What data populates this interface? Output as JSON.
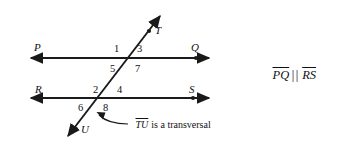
{
  "figure": {
    "type": "geometry-diagram",
    "colors": {
      "line": "#1a1a1a",
      "text": "#111111",
      "background": "#ffffff"
    },
    "points": [
      {
        "label": "P",
        "x": 34,
        "y": 42,
        "on": "line-pq",
        "dot_x": 38,
        "dot_y": 58
      },
      {
        "label": "Q",
        "x": 191,
        "y": 42,
        "on": "line-pq",
        "dot_x": 196,
        "dot_y": 58
      },
      {
        "label": "R",
        "x": 35,
        "y": 84,
        "on": "line-rs",
        "dot_x": 38,
        "dot_y": 98
      },
      {
        "label": "S",
        "x": 189,
        "y": 84,
        "on": "line-rs",
        "dot_x": 193,
        "dot_y": 98
      },
      {
        "label": "T",
        "x": 155,
        "y": 25,
        "on": "transversal",
        "dot_x": 148,
        "dot_y": 33
      },
      {
        "label": "U",
        "x": 81,
        "y": 124,
        "on": "transversal",
        "dot_x": 76,
        "dot_y": 130
      }
    ],
    "angle_numbers": [
      {
        "label": "1",
        "x": 114,
        "y": 44,
        "position": "upper-intersection-top-left"
      },
      {
        "label": "3",
        "x": 137,
        "y": 44,
        "position": "upper-intersection-top-right"
      },
      {
        "label": "5",
        "x": 110,
        "y": 64,
        "position": "upper-intersection-bottom-left"
      },
      {
        "label": "7",
        "x": 135,
        "y": 64,
        "position": "upper-intersection-bottom-right"
      },
      {
        "label": "2",
        "x": 93,
        "y": 85,
        "position": "lower-intersection-top-left"
      },
      {
        "label": "4",
        "x": 117,
        "y": 85,
        "position": "lower-intersection-top-right"
      },
      {
        "label": "6",
        "x": 78,
        "y": 103,
        "position": "lower-intersection-bottom-left"
      },
      {
        "label": "8",
        "x": 103,
        "y": 103,
        "position": "lower-intersection-bottom-right"
      }
    ],
    "annotation": {
      "segment": "TU",
      "text": " is a transversal",
      "x": 128,
      "y": 123
    },
    "parallel_statement": {
      "first_segment": "PQ",
      "symbol": "||",
      "second_segment": "RS",
      "x": 272,
      "y": 70
    },
    "lines": {
      "line_pq": {
        "y": 58,
        "x_start": 25,
        "x_end": 215,
        "label_start": "P",
        "label_end": "Q",
        "arrows": "both"
      },
      "line_rs": {
        "y": 98,
        "x_start": 25,
        "x_end": 215,
        "label_start": "R",
        "label_end": "S",
        "arrows": "both"
      },
      "transversal": {
        "x1": 63,
        "y1": 143,
        "x2": 165,
        "y2": 10,
        "label_start": "U",
        "label_end": "T",
        "arrows": "both"
      }
    }
  }
}
